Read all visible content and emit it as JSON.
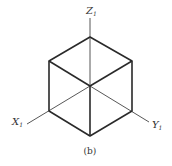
{
  "diagram": {
    "type": "isometric-cube-axes",
    "axes": {
      "z_label": "Z",
      "z_sub": "1",
      "x_label": "X",
      "x_sub": "1",
      "y_label": "Y",
      "y_sub": "1"
    },
    "caption": "(b)",
    "colors": {
      "line": "#2a2a2a",
      "text": "#333333",
      "background": "#ffffff"
    }
  }
}
